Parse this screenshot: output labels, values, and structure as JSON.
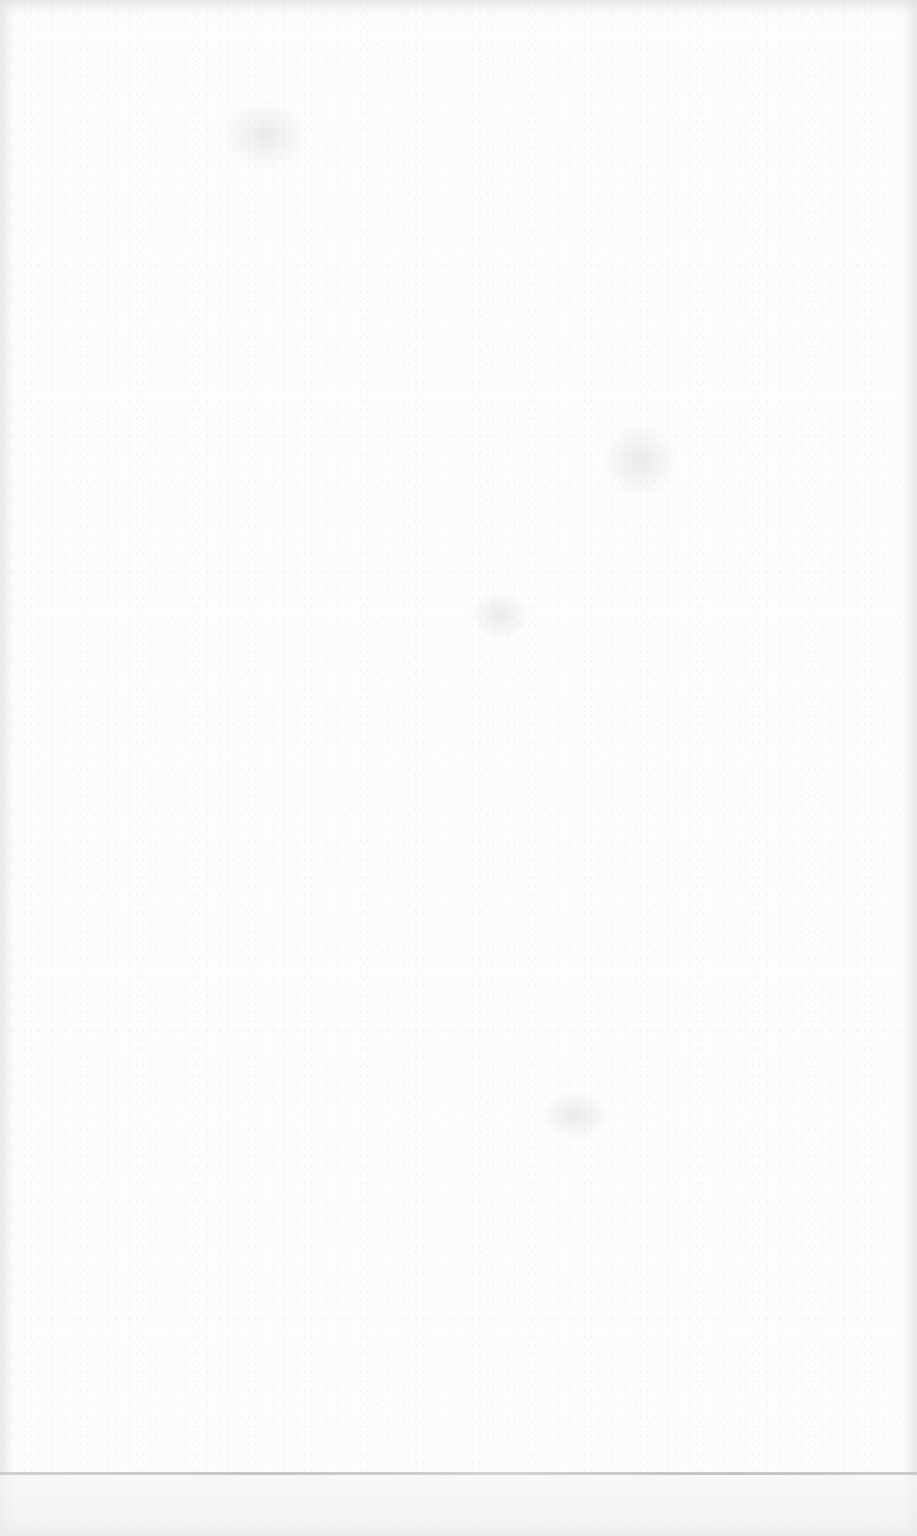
{
  "document": {
    "type": "blank scanned page",
    "text_content": "",
    "background_color": "#fdfdfd",
    "footer_rule": {
      "top_px": 1472,
      "color": "#c0c0c0"
    }
  }
}
